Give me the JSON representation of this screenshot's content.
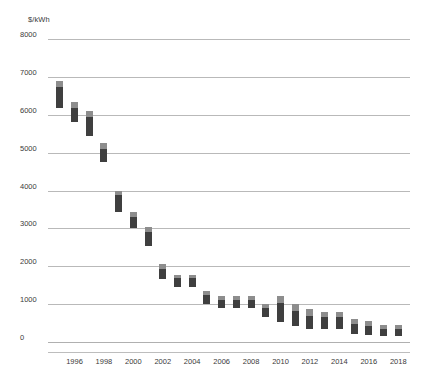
{
  "chart_data": {
    "type": "bar",
    "title": "",
    "subtitle": "",
    "xlabel": "",
    "ylabel": "$/kWh",
    "ylim": [
      0,
      8000
    ],
    "ytick_values": [
      0,
      1000,
      2000,
      3000,
      4000,
      5000,
      6000,
      7000,
      8000
    ],
    "ytick_labels": [
      "0",
      "1000",
      "2000",
      "3000",
      "4000",
      "5000",
      "6000",
      "7000",
      "8000"
    ],
    "xtick_labels": [
      "1996",
      "1998",
      "2000",
      "2002",
      "2004",
      "2006",
      "2008",
      "2010",
      "2012",
      "2014",
      "2016",
      "2018"
    ],
    "grid": true,
    "legend": false,
    "bar_style": "floating-range-two-segment",
    "segment_names": [
      "upper-range",
      "lower-range"
    ],
    "colors": {
      "upper_segment": "#8d8d8d",
      "lower_segment": "#3f3f3f",
      "gridline": "#b9b9b9",
      "axis_text": "#3a3a3a",
      "background": "#ffffff"
    },
    "x": [
      1995,
      1996,
      1997,
      1998,
      1999,
      2000,
      2001,
      2002,
      2003,
      2004,
      2005,
      2006,
      2007,
      2008,
      2009,
      2010,
      2011,
      2012,
      2013,
      2014,
      2015,
      2016,
      2017,
      2018
    ],
    "categories": [
      "1995",
      "1996",
      "1997",
      "1998",
      "1999",
      "2000",
      "2001",
      "2002",
      "2003",
      "2004",
      "2005",
      "2006",
      "2007",
      "2008",
      "2009",
      "2010",
      "2011",
      "2012",
      "2013",
      "2014",
      "2015",
      "2016",
      "2017",
      "2018"
    ],
    "bars": [
      {
        "x": 1995,
        "top": 6900,
        "mid": 6740,
        "bottom": 6180
      },
      {
        "x": 1996,
        "top": 6340,
        "mid": 6180,
        "bottom": 5810
      },
      {
        "x": 1997,
        "top": 6100,
        "mid": 5950,
        "bottom": 5450
      },
      {
        "x": 1998,
        "top": 5250,
        "mid": 5100,
        "bottom": 4760
      },
      {
        "x": 1999,
        "top": 4000,
        "mid": 3870,
        "bottom": 3420
      },
      {
        "x": 2000,
        "top": 3430,
        "mid": 3300,
        "bottom": 3010
      },
      {
        "x": 2001,
        "top": 3030,
        "mid": 2900,
        "bottom": 2540
      },
      {
        "x": 2002,
        "top": 2060,
        "mid": 1930,
        "bottom": 1660
      },
      {
        "x": 2003,
        "top": 1780,
        "mid": 1680,
        "bottom": 1450
      },
      {
        "x": 2004,
        "top": 1780,
        "mid": 1680,
        "bottom": 1450
      },
      {
        "x": 2005,
        "top": 1340,
        "mid": 1230,
        "bottom": 1000
      },
      {
        "x": 2006,
        "top": 1210,
        "mid": 1100,
        "bottom": 900
      },
      {
        "x": 2007,
        "top": 1210,
        "mid": 1100,
        "bottom": 900
      },
      {
        "x": 2008,
        "top": 1210,
        "mid": 1100,
        "bottom": 900
      },
      {
        "x": 2009,
        "top": 1000,
        "mid": 900,
        "bottom": 670
      },
      {
        "x": 2010,
        "top": 1210,
        "mid": 1030,
        "bottom": 520
      },
      {
        "x": 2011,
        "top": 1000,
        "mid": 820,
        "bottom": 420
      },
      {
        "x": 2012,
        "top": 870,
        "mid": 680,
        "bottom": 330
      },
      {
        "x": 2013,
        "top": 790,
        "mid": 650,
        "bottom": 350
      },
      {
        "x": 2014,
        "top": 790,
        "mid": 650,
        "bottom": 350
      },
      {
        "x": 2015,
        "top": 600,
        "mid": 470,
        "bottom": 210
      },
      {
        "x": 2016,
        "top": 560,
        "mid": 430,
        "bottom": 190
      },
      {
        "x": 2017,
        "top": 460,
        "mid": 350,
        "bottom": 170
      },
      {
        "x": 2018,
        "top": 450,
        "mid": 330,
        "bottom": 150
      }
    ]
  }
}
